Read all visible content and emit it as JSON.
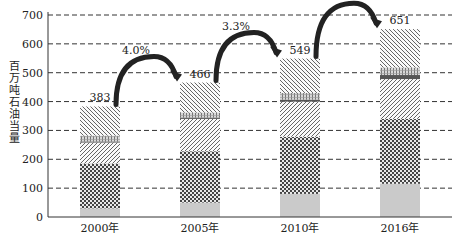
{
  "chart_data": {
    "type": "bar",
    "stacked": true,
    "title": "",
    "xlabel": "",
    "ylabel": "百万吨石油当量",
    "ylim": [
      0,
      700
    ],
    "yticks": [
      0,
      100,
      200,
      300,
      400,
      500,
      600,
      700
    ],
    "grid": "horizontal dashed",
    "categories": [
      "2000年",
      "2005年",
      "2010年",
      "2016年"
    ],
    "totals": [
      383,
      466,
      549,
      651
    ],
    "growth_annotations": [
      "4.0%",
      "3.3%",
      "3.5%"
    ],
    "series": [
      {
        "name": "segment-1 (light gray)",
        "pattern": "solid-gray",
        "values": [
          30,
          50,
          80,
          115
        ]
      },
      {
        "name": "segment-2 (crosshatch)",
        "pattern": "crosshatch",
        "values": [
          155,
          178,
          198,
          225
        ]
      },
      {
        "name": "segment-3 (forward diagonal)",
        "pattern": "diag-forward",
        "values": [
          73,
          112,
          122,
          138
        ]
      },
      {
        "name": "segment-4 (dark band)",
        "pattern": "dark",
        "values": [
          4,
          5,
          7,
          14
        ]
      },
      {
        "name": "segment-5 (vertical stripes)",
        "pattern": "vstripe",
        "values": [
          20,
          17,
          23,
          26
        ]
      },
      {
        "name": "segment-6 (back diagonal)",
        "pattern": "diag-back",
        "values": [
          101,
          104,
          119,
          133
        ]
      }
    ]
  },
  "colors": {
    "axis": "#333333",
    "grid": "#333333",
    "arrow": "#222222",
    "gray": "#c8c8c8"
  }
}
